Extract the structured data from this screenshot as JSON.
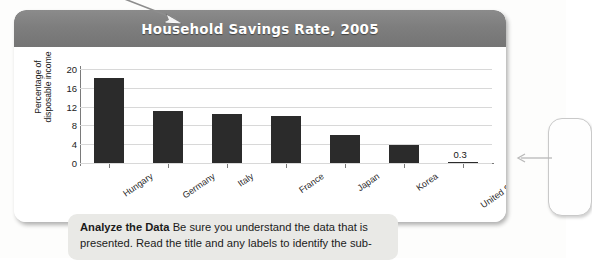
{
  "chart_card": {
    "title": "Household Savings Rate, 2005"
  },
  "chart_data": {
    "type": "bar",
    "title": "Household Savings Rate, 2005",
    "xlabel": "",
    "ylabel": "Percentage of disposable income",
    "ylabel_line1": "Percentage of",
    "ylabel_line2": "disposable income",
    "categories": [
      "Hungary",
      "Germany",
      "Italy",
      "France",
      "Japan",
      "Korea",
      "United States"
    ],
    "values": [
      18.0,
      11.0,
      10.5,
      10.0,
      6.0,
      3.9,
      0.3
    ],
    "value_labels": [
      "",
      "",
      "",
      "",
      "",
      "",
      "0.3"
    ],
    "ylim": [
      0,
      20
    ],
    "yticks": [
      20,
      16,
      12,
      8,
      4,
      0
    ],
    "ytick_labels": [
      "20",
      "16",
      "12",
      "8",
      "4",
      "0"
    ],
    "grid": true,
    "legend": "none",
    "bar_color": "#2b2b2b",
    "grid_color": "#d8d8d8",
    "axis_color": "#7a7a7a",
    "title_bar_color": "#7e7e7e"
  },
  "annotations": {
    "top_arrow": "arrow-pointing-to-title",
    "side_leader": "arrow-pointing-to-callout"
  },
  "caption": {
    "lead": "Analyze the Data",
    "body": "Be sure you understand the data that is presented. Read the title and any labels to identify the sub-"
  }
}
